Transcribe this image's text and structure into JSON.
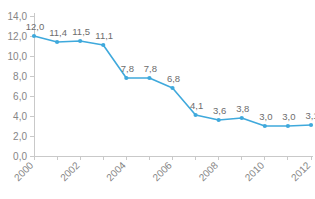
{
  "chart_data": {
    "type": "line",
    "title": "",
    "subtitle": "",
    "xlabel": "",
    "ylabel": "",
    "categories": [
      "2000",
      "2001",
      "2002",
      "2003",
      "2004",
      "2005",
      "2006",
      "2007",
      "2008",
      "2009",
      "2010",
      "2011",
      "2012"
    ],
    "values": [
      12.0,
      11.4,
      11.5,
      11.1,
      7.8,
      7.8,
      6.8,
      4.1,
      3.6,
      3.8,
      3.0,
      3.0,
      3.1
    ],
    "value_labels": [
      "12,0",
      "11,4",
      "11,5",
      "11,1",
      "7,8",
      "7,8",
      "6,8",
      "4,1",
      "3,6",
      "3,8",
      "3,0",
      "3,0",
      "3,1"
    ],
    "series": [
      {
        "name": "",
        "values": [
          12.0,
          11.4,
          11.5,
          11.1,
          7.8,
          7.8,
          6.8,
          4.1,
          3.6,
          3.8,
          3.0,
          3.0,
          3.1
        ],
        "color": "#3FA9DC"
      }
    ],
    "ylim": [
      0.0,
      14.0
    ],
    "ytick_values": [
      0.0,
      2.0,
      4.0,
      6.0,
      8.0,
      10.0,
      12.0,
      14.0
    ],
    "ytick_labels": [
      "0,0",
      "2,0",
      "4,0",
      "6,0",
      "8,0",
      "10,0",
      "12,0",
      "14,0"
    ],
    "xtick_labels": [
      "2000",
      "2002",
      "2004",
      "2006",
      "2008",
      "2010",
      "2012"
    ],
    "xtick_all": [
      "2000",
      "2001",
      "2002",
      "2003",
      "2004",
      "2005",
      "2006",
      "2007",
      "2008",
      "2009",
      "2010",
      "2011",
      "2012"
    ],
    "grid": false,
    "legend": false,
    "legend_position": "none",
    "decimal_separator": ",",
    "data_labels_shown": true,
    "xtick_label_rotation_deg": 45
  },
  "colors": {
    "series_line": "#3FA9DC",
    "series_marker": "#3FA9DC",
    "axis": "#c9c9c9",
    "tick_text": "#868686",
    "value_text": "#6d6d6d",
    "background": "#ffffff"
  }
}
